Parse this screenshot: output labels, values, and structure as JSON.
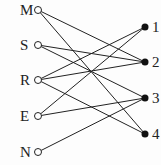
{
  "diagram": {
    "type": "bipartite-graph",
    "left_nodes": [
      {
        "id": "M",
        "label": "M",
        "x": 38,
        "y": 10
      },
      {
        "id": "S",
        "label": "S",
        "x": 38,
        "y": 45
      },
      {
        "id": "R",
        "label": "R",
        "x": 38,
        "y": 80
      },
      {
        "id": "E",
        "label": "E",
        "x": 38,
        "y": 116
      },
      {
        "id": "N",
        "label": "N",
        "x": 38,
        "y": 152
      }
    ],
    "right_nodes": [
      {
        "id": "1",
        "label": "1",
        "x": 145,
        "y": 27
      },
      {
        "id": "2",
        "label": "2",
        "x": 145,
        "y": 62
      },
      {
        "id": "3",
        "label": "3",
        "x": 145,
        "y": 98
      },
      {
        "id": "4",
        "label": "4",
        "x": 145,
        "y": 134
      }
    ],
    "edges": [
      [
        "M",
        "2"
      ],
      [
        "M",
        "4"
      ],
      [
        "S",
        "2"
      ],
      [
        "S",
        "3"
      ],
      [
        "R",
        "1"
      ],
      [
        "R",
        "2"
      ],
      [
        "R",
        "4"
      ],
      [
        "E",
        "1"
      ],
      [
        "E",
        "3"
      ],
      [
        "N",
        "3"
      ]
    ],
    "colors": {
      "line": "#222222",
      "open_node_fill": "#ffffff",
      "filled_node": "#111111"
    }
  }
}
